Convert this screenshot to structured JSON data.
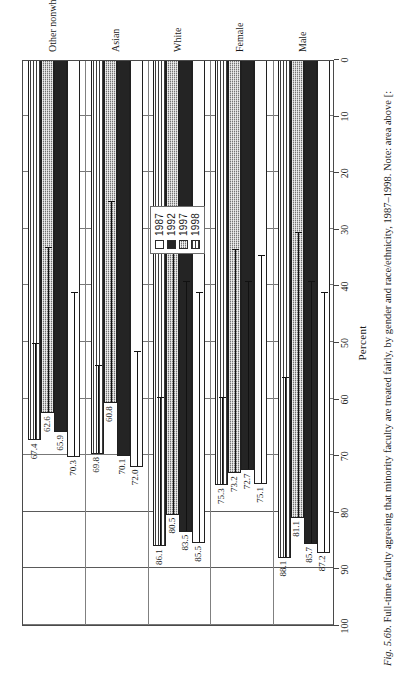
{
  "figure": {
    "caption_figno": "Fig. 5.6b.",
    "caption_text": " Full-time faculty agreeing that minority faculty are treated fairly, by gender and race/ethnicity, 1987–1998. Note: area above [:"
  },
  "legend": {
    "position": "top-center",
    "entries": [
      {
        "label": "1987",
        "swatch": "white-dotted-swatch"
      },
      {
        "label": "1992",
        "swatch": "black-solid-swatch"
      },
      {
        "label": "1997",
        "swatch": "gray-crosshatch-swatch"
      },
      {
        "label": "1998",
        "swatch": "horizontal-stripe-swatch"
      }
    ]
  },
  "axis": {
    "title": "Percent",
    "ticks": [
      "100",
      "90",
      "80",
      "70",
      "60",
      "50",
      "40",
      "30",
      "20",
      "10",
      "0"
    ],
    "min": 0,
    "max": 100,
    "reversed": true
  },
  "chart_data": {
    "type": "bar",
    "orientation": "horizontal",
    "xlabel": "Percent",
    "ylabel": "",
    "xlim": [
      0,
      100
    ],
    "x_axis_reversed": true,
    "grid": true,
    "legend_position": "top-center",
    "categories": [
      "Male",
      "Female",
      "White",
      "Asian",
      "Other nonwhite"
    ],
    "series": [
      {
        "name": "1987",
        "values": [
          87.2,
          75.1,
          85.5,
          72.0,
          70.3
        ]
      },
      {
        "name": "1992",
        "values": [
          85.7,
          72.7,
          83.5,
          70.1,
          65.9
        ]
      },
      {
        "name": "1997",
        "values": [
          81.1,
          73.2,
          80.5,
          60.8,
          62.6
        ]
      },
      {
        "name": "1998",
        "values": [
          88.1,
          75.3,
          86.1,
          69.8,
          67.4
        ]
      }
    ],
    "data_labels": {
      "Male": {
        "1987": "87.2",
        "1992": "85.7",
        "1997": "81.1",
        "1998": "88.1"
      },
      "Female": {
        "1987": "75.1",
        "1992": "72.7",
        "1997": "73.2",
        "1998": "75.3"
      },
      "White": {
        "1987": "85.5",
        "1992": "83.5",
        "1997": "80.5",
        "1998": "86.1"
      },
      "Asian": {
        "1987": "72.0",
        "1992": "70.1",
        "1997": "60.8",
        "1998": "69.8"
      },
      "Other nonwhite": {
        "1987": "70.3",
        "1992": "65.9",
        "1997": "62.6",
        "1998": "67.4"
      }
    },
    "overlay_markers": {
      "description": "inner horizontal rule with end cap drawn inside each bar",
      "Male": {
        "1987": 41.5,
        "1992": 39.5,
        "1997": 31.0,
        "1998": 56.5
      },
      "Female": {
        "1987": 35.0,
        "1992": 39.5,
        "1997": 34.0,
        "1998": 60.0
      },
      "White": {
        "1987": 41.5,
        "1992": 39.5,
        "1997": 27.5,
        "1998": 60.0
      },
      "Asian": {
        "1987": 52.0,
        "1992": 0,
        "1997": 25.5,
        "1998": 54.5
      },
      "Other nonwhite": {
        "1987": 41.5,
        "1992": 0,
        "1997": 33.5,
        "1998": 50.5
      }
    }
  },
  "colors": {
    "frame": "#4a4a4a",
    "grid": "#777777",
    "series_1987": "#ffffff",
    "series_1992": "#242424",
    "series_1997": "#bdbdbd",
    "series_1998": "#ffffff",
    "text": "#1a1a1a"
  }
}
